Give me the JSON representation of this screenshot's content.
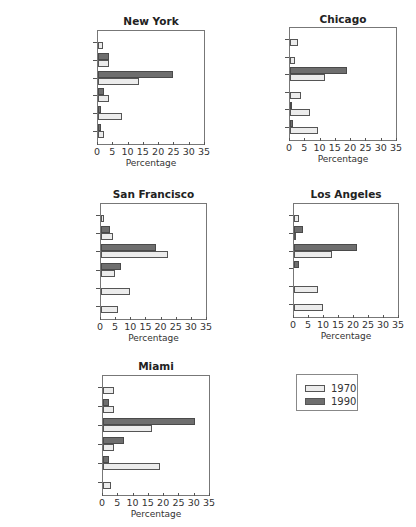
{
  "legend": {
    "items": [
      {
        "label": "1970",
        "color": "#ececec"
      },
      {
        "label": "1990",
        "color": "#6e6e6e"
      }
    ]
  },
  "chart_data": [
    {
      "type": "bar",
      "orientation": "horizontal",
      "title": "New York",
      "xlabel": "Percentage",
      "xlim": [
        0,
        35
      ],
      "xticks": [
        0,
        5,
        10,
        15,
        20,
        25,
        30,
        35
      ],
      "categories": [
        "Other",
        "TCU",
        "Public",
        "Professional services",
        "Personal services",
        "Manufacturing"
      ],
      "series": [
        {
          "name": "1990",
          "values": [
            0,
            3.5,
            24.5,
            2,
            1,
            1
          ]
        },
        {
          "name": "1970",
          "values": [
            1.5,
            3.5,
            13.5,
            3.5,
            8,
            2
          ]
        }
      ],
      "layout": {
        "plot": [
          97,
          30,
          108,
          115
        ],
        "title_y": 15
      }
    },
    {
      "type": "bar",
      "orientation": "horizontal",
      "title": "Chicago",
      "xlabel": "Percentage",
      "xlim": [
        0,
        35
      ],
      "xticks": [
        0,
        5,
        10,
        15,
        20,
        25,
        30,
        35
      ],
      "categories": [
        "Other",
        "TCU",
        "Public",
        "Professional services",
        "Personal services",
        "Manufacturing"
      ],
      "series": [
        {
          "name": "1990",
          "values": [
            0,
            0,
            18.5,
            0,
            0.5,
            1
          ]
        },
        {
          "name": "1970",
          "values": [
            2.5,
            1.5,
            11.5,
            3.5,
            6.5,
            9
          ]
        }
      ],
      "layout": {
        "plot": [
          289,
          27,
          108,
          114
        ],
        "title_y": 13
      }
    },
    {
      "type": "bar",
      "orientation": "horizontal",
      "title": "San Francisco",
      "xlabel": "Percentage",
      "xlim": [
        0,
        35
      ],
      "xticks": [
        0,
        5,
        10,
        15,
        20,
        25,
        30,
        35
      ],
      "categories": [
        "Other",
        "TCU",
        "Public",
        "Professional services",
        "Personal services",
        "Manufacturing"
      ],
      "series": [
        {
          "name": "1990",
          "values": [
            0,
            3,
            18,
            6.5,
            0,
            0
          ]
        },
        {
          "name": "1970",
          "values": [
            1,
            4,
            22,
            4.5,
            9.5,
            5.5
          ]
        }
      ],
      "layout": {
        "plot": [
          100,
          203,
          107,
          117
        ],
        "title_y": 188
      }
    },
    {
      "type": "bar",
      "orientation": "horizontal",
      "title": "Los Angeles",
      "xlabel": "Percentage",
      "xlim": [
        0,
        35
      ],
      "xticks": [
        0,
        5,
        10,
        15,
        20,
        25,
        30,
        35
      ],
      "categories": [
        "Other",
        "TCU",
        "Public",
        "Professional services",
        "Personal services",
        "Manufacturing"
      ],
      "series": [
        {
          "name": "1990",
          "values": [
            0,
            3,
            21,
            1.5,
            0,
            0
          ]
        },
        {
          "name": "1970",
          "values": [
            1.5,
            0.5,
            12.5,
            0,
            8,
            9.5
          ]
        }
      ],
      "layout": {
        "plot": [
          293,
          203,
          106,
          115
        ],
        "title_y": 188
      }
    },
    {
      "type": "bar",
      "orientation": "horizontal",
      "title": "Miami",
      "xlabel": "Percentage",
      "xlim": [
        0,
        35
      ],
      "xticks": [
        0,
        5,
        10,
        15,
        20,
        25,
        30,
        35
      ],
      "categories": [
        "Other",
        "TCU",
        "Public",
        "Professional services",
        "Personal services",
        "Manufacturing"
      ],
      "series": [
        {
          "name": "1990",
          "values": [
            0,
            2,
            30,
            7,
            2,
            0
          ]
        },
        {
          "name": "1970",
          "values": [
            3.5,
            3.5,
            16,
            3.5,
            18.5,
            2.5
          ]
        }
      ],
      "layout": {
        "plot": [
          102,
          375,
          108,
          121
        ],
        "title_y": 360
      }
    }
  ]
}
